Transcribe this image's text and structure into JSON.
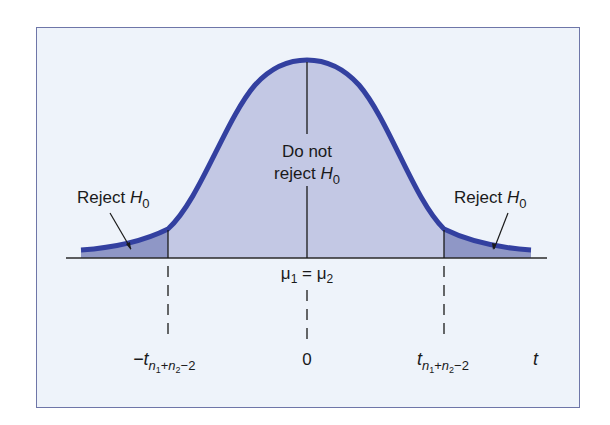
{
  "diagram": {
    "labels": {
      "reject_left": "Reject",
      "reject_right": "Reject",
      "hypothesis_symbol": "H",
      "hypothesis_subscript": "0",
      "do_not_line1": "Do not",
      "do_not_line2": "reject",
      "mean_equality": {
        "mu": "μ",
        "sub1": "1",
        "equals": " = ",
        "sub2": "2"
      },
      "zero": "0",
      "axis_variable": "t",
      "critical_left": {
        "prefix": "−t",
        "sub_n": "n",
        "sub_1": "1",
        "plus": "+",
        "sub_n2": "n",
        "sub_2": "2",
        "minus_2": "−2"
      },
      "critical_right": {
        "prefix": "t",
        "sub_n": "n",
        "sub_1": "1",
        "plus": "+",
        "sub_n2": "n",
        "sub_2": "2",
        "minus_2": "−2"
      }
    },
    "colors": {
      "background": "#eef3fa",
      "frame_border": "#6e76a8",
      "curve": "#3340a0",
      "center_fill": "#c3c8e4",
      "tail_fill": "#8f97c6",
      "text": "#1a1a1a"
    }
  }
}
